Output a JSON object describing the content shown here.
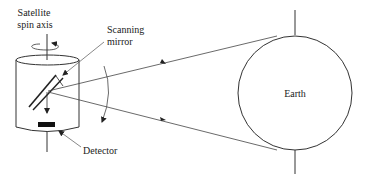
{
  "diagram": {
    "labels": {
      "spin_axis_line1": "Satellite",
      "spin_axis_line2": "spin axis",
      "mirror_line1": "Scanning",
      "mirror_line2": "mirror",
      "detector": "Detector",
      "earth": "Earth"
    },
    "colors": {
      "stroke": "#333333",
      "fill": "#ffffff",
      "detector": "#111111"
    }
  }
}
